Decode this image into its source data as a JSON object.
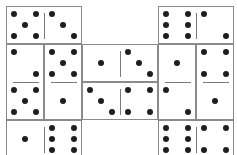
{
  "board": {
    "cell": 38,
    "origin": [
      6,
      6
    ],
    "colors": {
      "pip": "#1e1e1e",
      "border": "#8a8a8a",
      "divider": "#7a7a7a",
      "background": "#ffffff"
    },
    "dominoes": [
      {
        "id": "d1",
        "col": 0,
        "row": 0,
        "orient": "h",
        "values": [
          5,
          3
        ]
      },
      {
        "id": "d2",
        "col": 4,
        "row": 0,
        "orient": "h",
        "values": [
          6,
          2
        ]
      },
      {
        "id": "d3",
        "col": 0,
        "row": 1,
        "orient": "v",
        "values": [
          2,
          5
        ]
      },
      {
        "id": "d4",
        "col": 1,
        "row": 1,
        "orient": "v",
        "values": [
          5,
          1
        ]
      },
      {
        "id": "d5",
        "col": 2,
        "row": 1,
        "orient": "h",
        "values": [
          1,
          3
        ]
      },
      {
        "id": "d6",
        "col": 2,
        "row": 2,
        "orient": "h",
        "values": [
          3,
          4
        ]
      },
      {
        "id": "d7",
        "col": 4,
        "row": 1,
        "orient": "v",
        "values": [
          1,
          2
        ]
      },
      {
        "id": "d8",
        "col": 5,
        "row": 1,
        "orient": "v",
        "values": [
          4,
          1
        ]
      },
      {
        "id": "d9",
        "col": 0,
        "row": 3,
        "orient": "h",
        "values": [
          1,
          6
        ]
      },
      {
        "id": "d10",
        "col": 4,
        "row": 3,
        "orient": "h",
        "values": [
          6,
          4
        ]
      }
    ]
  }
}
